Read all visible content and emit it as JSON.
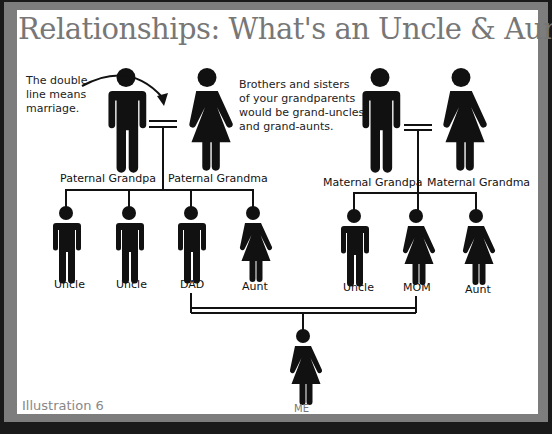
{
  "title": "Relationships: What's an Uncle & Aunt?",
  "notes": {
    "marriage": [
      "The double",
      "line means",
      "marriage."
    ],
    "grand": [
      "Brothers and sisters",
      "of your grandparents",
      "would be grand-uncles",
      "and grand-aunts."
    ]
  },
  "labels": {
    "paternal_grandpa": "Paternal Grandpa",
    "paternal_grandma": "Paternal Grandma",
    "maternal_grandpa": "Maternal Grandpa",
    "maternal_grandma": "Maternal Grandma",
    "p_child1": "Uncle",
    "p_child2": "Uncle",
    "dad": "DAD",
    "p_child4": "Aunt",
    "m_child1": "Uncle",
    "mom": "MOM",
    "m_child3": "Aunt",
    "me": "ME"
  },
  "caption": "Illustration 6",
  "colors": {
    "figure": "#111111",
    "frame": "#7d7d7d",
    "title": "#777777"
  }
}
